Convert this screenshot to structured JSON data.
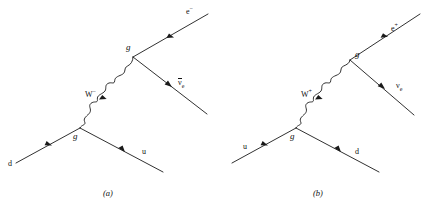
{
  "figure": {
    "background_color": "#ffffff",
    "line_color": "#1a1a1a",
    "type": "feynman-diagram-pair"
  },
  "diagrams": [
    {
      "caption": "(a)",
      "process": "d -> u + W- , W- -> e- + anti-nu_e",
      "incoming_quark": "d",
      "outgoing_quark": "u",
      "boson": {
        "symbol": "W",
        "charge": "−"
      },
      "lepton": {
        "symbol": "e",
        "charge": "−"
      },
      "neutrino": {
        "symbol": "ν",
        "subscript": "e",
        "antiparticle": true
      },
      "vertex_lower_label": "g",
      "vertex_upper_label": "g"
    },
    {
      "caption": "(b)",
      "process": "u -> d + W+ , W+ -> e+ + nu_e",
      "incoming_quark": "u",
      "outgoing_quark": "d",
      "boson": {
        "symbol": "W",
        "charge": "+"
      },
      "lepton": {
        "symbol": "e",
        "charge": "+"
      },
      "neutrino": {
        "symbol": "ν",
        "subscript": "e",
        "antiparticle": false
      },
      "vertex_lower_label": "g",
      "vertex_upper_label": "g"
    }
  ],
  "labels": {
    "a": {
      "d_quark": "d",
      "u_quark": "u",
      "electron": "e",
      "electron_charge": "−",
      "neutrino": "ν",
      "neutrino_sub": "e",
      "boson": "W",
      "boson_charge": "−",
      "vertex_lower": "g",
      "vertex_upper": "g",
      "caption": "(a)"
    },
    "b": {
      "u_quark": "u",
      "d_quark": "d",
      "positron": "e",
      "positron_charge": "+",
      "neutrino": "ν",
      "neutrino_sub": "e",
      "boson": "W",
      "boson_charge": "+",
      "vertex_lower": "g",
      "vertex_upper": "g",
      "caption": "(b)"
    }
  }
}
